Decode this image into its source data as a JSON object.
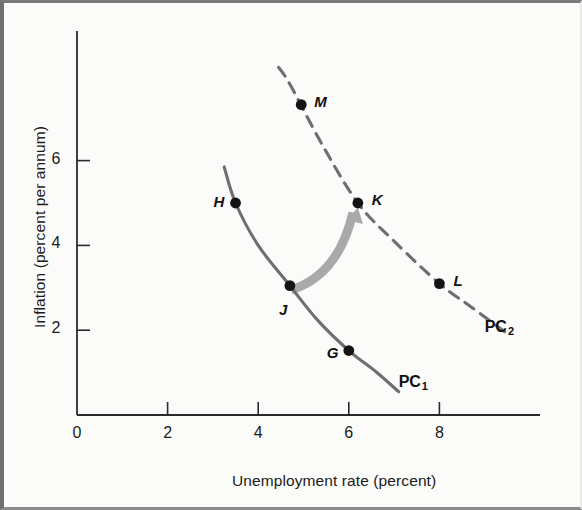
{
  "figure": {
    "background": "#fbfbfa",
    "ink_color": "#1b1b1b",
    "curve_color": "#6e6f71",
    "arrow_color": "#a9a9a9"
  },
  "chart_data": {
    "type": "line",
    "title": "",
    "xlabel": "Unemployment rate (percent)",
    "ylabel": "Inflation (percent per annum)",
    "xlim": [
      0,
      9.6
    ],
    "ylim": [
      0,
      8.6
    ],
    "xticks": [
      0,
      2,
      4,
      6,
      8
    ],
    "xtick_labels": [
      "0",
      "2",
      "4",
      "6",
      "8"
    ],
    "yticks": [
      2,
      4,
      6
    ],
    "ytick_labels": [
      "2",
      "4",
      "6"
    ],
    "grid": false,
    "legend": "none",
    "series": [
      {
        "name": "PC1",
        "label": "PC",
        "label_sub": "1",
        "style": "solid",
        "color": "#6e6f71",
        "label_x": 7.1,
        "label_y": 0.72,
        "x": [
          3.25,
          3.5,
          4.0,
          4.7,
          5.3,
          6.0,
          6.6,
          7.1
        ],
        "y": [
          5.85,
          5.0,
          4.0,
          3.05,
          2.25,
          1.52,
          1.02,
          0.55
        ]
      },
      {
        "name": "PC2",
        "label": "PC",
        "label_sub": "2",
        "style": "dashed",
        "color": "#6e6f71",
        "label_x": 9.0,
        "label_y": 2.02,
        "x": [
          4.45,
          4.7,
          5.4,
          6.2,
          7.0,
          8.0,
          8.7,
          9.55
        ],
        "y": [
          8.2,
          7.8,
          6.4,
          5.0,
          4.1,
          3.1,
          2.55,
          1.88
        ]
      }
    ],
    "points": [
      {
        "label": "H",
        "x": 3.5,
        "y": 5.0,
        "label_dx": -22,
        "label_dy": -1
      },
      {
        "label": "J",
        "x": 4.7,
        "y": 3.05,
        "label_dx": -11,
        "label_dy": 24
      },
      {
        "label": "G",
        "x": 6.0,
        "y": 1.52,
        "label_dx": -22,
        "label_dy": 2
      },
      {
        "label": "M",
        "x": 4.95,
        "y": 7.32,
        "label_dx": 13,
        "label_dy": -3
      },
      {
        "label": "K",
        "x": 6.2,
        "y": 5.0,
        "label_dx": 14,
        "label_dy": -3
      },
      {
        "label": "L",
        "x": 8.0,
        "y": 3.1,
        "label_dx": 14,
        "label_dy": -3
      }
    ],
    "annotations": [
      {
        "name": "shift-arrow",
        "type": "curved-arrow",
        "from_label": "J",
        "to_label": "K",
        "from_x": 4.73,
        "from_y": 2.95,
        "to_x": 6.18,
        "to_y": 4.92,
        "color": "#a9a9a9"
      }
    ]
  }
}
